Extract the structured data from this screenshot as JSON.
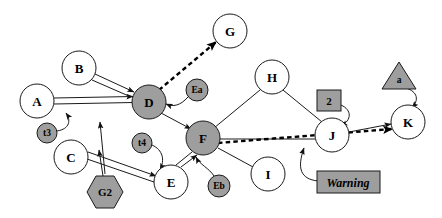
{
  "diagram": {
    "background": "#ffffff",
    "colors": {
      "node_fill_white": "#ffffff",
      "node_fill_gray": "#9e9e9e",
      "box_fill_gray": "#9e9e9e",
      "stroke": "#1a1a1a",
      "text": "#000000",
      "dashed_edge": "#000000"
    },
    "nodes": [
      {
        "id": "A",
        "label": "A",
        "shape": "circle",
        "fill": "white",
        "cx": 37,
        "cy": 101,
        "r": 17,
        "size": "lg"
      },
      {
        "id": "B",
        "label": "B",
        "shape": "circle",
        "fill": "white",
        "cx": 79,
        "cy": 68,
        "r": 17,
        "size": "lg"
      },
      {
        "id": "C",
        "label": "C",
        "shape": "circle",
        "fill": "white",
        "cx": 71,
        "cy": 157,
        "r": 17,
        "size": "lg"
      },
      {
        "id": "D",
        "label": "D",
        "shape": "circle",
        "fill": "gray",
        "cx": 149,
        "cy": 102,
        "r": 17,
        "size": "lg"
      },
      {
        "id": "E",
        "label": "E",
        "shape": "circle",
        "fill": "white",
        "cx": 171,
        "cy": 182,
        "r": 17,
        "size": "lg"
      },
      {
        "id": "F",
        "label": "F",
        "shape": "circle",
        "fill": "gray",
        "cx": 203,
        "cy": 138,
        "r": 17,
        "size": "lg"
      },
      {
        "id": "G",
        "label": "G",
        "shape": "circle",
        "fill": "white",
        "cx": 230,
        "cy": 31,
        "r": 17,
        "size": "lg"
      },
      {
        "id": "H",
        "label": "H",
        "shape": "circle",
        "fill": "white",
        "cx": 272,
        "cy": 77,
        "r": 17,
        "size": "lg"
      },
      {
        "id": "I",
        "label": "I",
        "shape": "circle",
        "fill": "white",
        "cx": 268,
        "cy": 174,
        "r": 17,
        "size": "lg"
      },
      {
        "id": "J",
        "label": "J",
        "shape": "circle",
        "fill": "white",
        "cx": 332,
        "cy": 135,
        "r": 17,
        "size": "lg"
      },
      {
        "id": "K",
        "label": "K",
        "shape": "circle",
        "fill": "white",
        "cx": 408,
        "cy": 122,
        "r": 17,
        "size": "lg"
      },
      {
        "id": "Ea",
        "label": "Ea",
        "shape": "circle",
        "fill": "gray",
        "cx": 197,
        "cy": 90,
        "r": 11,
        "size": "sm"
      },
      {
        "id": "Eb",
        "label": "Eb",
        "shape": "circle",
        "fill": "gray",
        "cx": 219,
        "cy": 186,
        "r": 11,
        "size": "sm"
      },
      {
        "id": "t3",
        "label": "t3",
        "shape": "circle",
        "fill": "gray",
        "cx": 47,
        "cy": 133,
        "r": 10,
        "size": "sm"
      },
      {
        "id": "t4",
        "label": "t4",
        "shape": "circle",
        "fill": "gray",
        "cx": 142,
        "cy": 143,
        "r": 10,
        "size": "sm"
      },
      {
        "id": "G2",
        "label": "G2",
        "shape": "hexagon",
        "fill": "gray",
        "cx": 105,
        "cy": 192,
        "r": 18,
        "size": "md"
      },
      {
        "id": "a",
        "label": "a",
        "shape": "triangle",
        "fill": "gray",
        "cx": 399,
        "cy": 78,
        "r": 17,
        "size": "sm"
      },
      {
        "id": "2",
        "label": "2",
        "shape": "rect",
        "fill": "gray",
        "cx": 329,
        "cy": 101,
        "r": 12,
        "size": "md"
      },
      {
        "id": "Warning",
        "label": "Warning",
        "shape": "rect-wide",
        "fill": "gray",
        "cx": 348,
        "cy": 182,
        "r": 12,
        "size": "warn"
      }
    ],
    "edges": [
      {
        "from": "A",
        "to": "D",
        "style": "solid-double",
        "arrow": true
      },
      {
        "from": "B",
        "to": "D",
        "style": "solid-double",
        "arrow": true
      },
      {
        "from": "D",
        "to": "G",
        "style": "dashed-thick",
        "arrow": true
      },
      {
        "from": "Ea",
        "to": "D",
        "style": "curved",
        "arrow": true
      },
      {
        "from": "D",
        "to": "F",
        "style": "solid",
        "arrow": true
      },
      {
        "from": "t3",
        "to": "A",
        "style": "curved",
        "arrow": true
      },
      {
        "from": "t4",
        "to": "E",
        "style": "curved",
        "arrow": true
      },
      {
        "from": "C",
        "to": "E",
        "style": "solid-double",
        "arrow": true
      },
      {
        "from": "G2",
        "to": "D",
        "style": "solid",
        "arrow": true
      },
      {
        "from": "G2",
        "to": "C",
        "style": "solid",
        "arrow": true
      },
      {
        "from": "E",
        "to": "F",
        "style": "solid-double",
        "arrow": true
      },
      {
        "from": "Eb",
        "to": "F",
        "style": "curved",
        "arrow": true
      },
      {
        "from": "H",
        "to": "F",
        "style": "solid",
        "arrow": false
      },
      {
        "from": "H",
        "to": "J",
        "style": "solid",
        "arrow": false
      },
      {
        "from": "F",
        "to": "I",
        "style": "solid",
        "arrow": false
      },
      {
        "from": "F",
        "to": "J",
        "style": "solid",
        "arrow": false
      },
      {
        "from": "F",
        "to": "K",
        "style": "dashed-thick",
        "arrow": true
      },
      {
        "from": "J",
        "to": "K",
        "style": "solid",
        "arrow": true
      },
      {
        "from": "2",
        "to": "J",
        "style": "curved",
        "arrow": true
      },
      {
        "from": "a",
        "to": "K",
        "style": "curved",
        "arrow": true
      },
      {
        "from": "Warning",
        "to": "J",
        "style": "curved",
        "arrow": true
      }
    ]
  }
}
